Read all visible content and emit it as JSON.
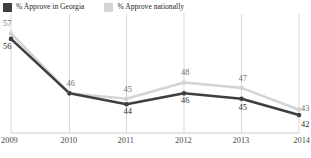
{
  "legend": {
    "entries": [
      {
        "label": "% Approve in Georgia",
        "color": "#3f3f3f",
        "icon": "legend-swatch-dark"
      },
      {
        "label": "% Approve nationally",
        "color": "#d4d4d4",
        "icon": "legend-swatch-light"
      }
    ]
  },
  "axis": {
    "x_ticks": [
      "2009",
      "2010",
      "2011",
      "2012",
      "2013",
      "2014"
    ]
  },
  "labels": {
    "georgia": [
      "56",
      "46",
      "44",
      "46",
      "45",
      "42"
    ],
    "national": [
      "57",
      "46",
      "45",
      "48",
      "47",
      "43"
    ]
  },
  "chart_data": {
    "type": "line",
    "title": "",
    "subtitle": "",
    "xlabel": "",
    "ylabel": "",
    "x": [
      "2009",
      "2010",
      "2011",
      "2012",
      "2013",
      "2014"
    ],
    "categories": [
      "2009",
      "2010",
      "2011",
      "2012",
      "2013",
      "2014"
    ],
    "series": [
      {
        "name": "% Approve in Georgia",
        "color": "#3f3f3f",
        "values": [
          56,
          46,
          44,
          46,
          45,
          42
        ],
        "data_labels": [
          "56",
          "46",
          "44",
          "46",
          "45",
          "42"
        ]
      },
      {
        "name": "% Approve nationally",
        "color": "#d4d4d4",
        "values": [
          57,
          46,
          45,
          48,
          47,
          43
        ],
        "data_labels": [
          "57",
          "46",
          "45",
          "48",
          "47",
          "43"
        ]
      }
    ],
    "ylim": [
      40,
      58
    ],
    "grid": "vertical",
    "legend_position": "top-left",
    "note": "2010 data labels shared: both series read 46"
  }
}
